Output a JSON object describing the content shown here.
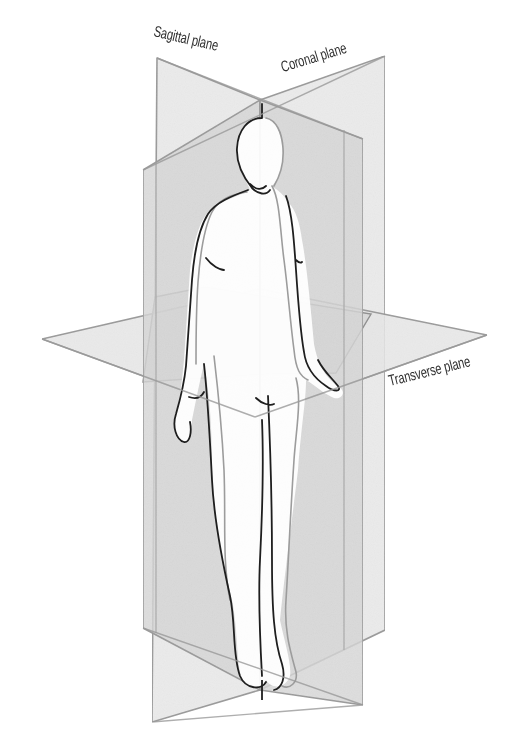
{
  "diagram": {
    "labels": {
      "sagittal": "Sagittal plane",
      "coronal": "Coronal plane",
      "transverse": "Transverse plane"
    },
    "colors": {
      "background": "#ffffff",
      "plane_fill_light": "#ececec",
      "plane_fill_dark": "#d2d2d2",
      "plane_edge": "#9a9a9a",
      "figure_outline": "#1e1e1e",
      "figure_fill": "#ffffff",
      "label_text": "#2f2f2f"
    }
  }
}
